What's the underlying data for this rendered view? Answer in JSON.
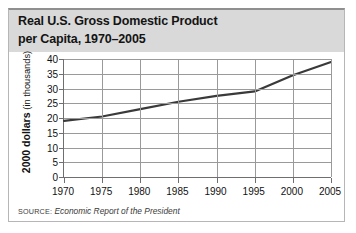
{
  "figure": {
    "title_line1": "Real U.S. Gross Domestic Product",
    "title_line2": "per Capita, 1970–2005",
    "source_label": "SOURCE:",
    "source_text": "Economic Report of the President",
    "colors": {
      "title_band": "#d9d9d9",
      "line": "#3a3a3a",
      "grid": "#9a9a9a",
      "axis": "#6f6f6f",
      "border": "#b6b6b6",
      "text": "#111111"
    }
  },
  "chart_data": {
    "type": "line",
    "title": "Real U.S. Gross Domestic Product per Capita, 1970–2005",
    "xlabel": "",
    "ylabel": "2000 dollars (in thousands)",
    "ylabel_bold": "2000 dollars",
    "ylabel_normal": "(in thousands)",
    "x": [
      1970,
      1975,
      1980,
      1985,
      1990,
      1995,
      2000,
      2005
    ],
    "values": [
      19,
      20.5,
      23,
      25.5,
      27.5,
      29,
      34.5,
      39
    ],
    "xtick_labels": [
      "1970",
      "1975",
      "1980",
      "1985",
      "1990",
      "1995",
      "2000",
      "2005"
    ],
    "ytick_labels": [
      "40",
      "35",
      "30",
      "25",
      "20",
      "15",
      "10",
      "5",
      "0"
    ],
    "yticks": [
      40,
      35,
      30,
      25,
      20,
      15,
      10,
      5,
      0
    ],
    "xlim": [
      1970,
      2005
    ],
    "ylim": [
      0,
      40
    ],
    "grid": true,
    "legend": "none",
    "series_name": "Real GDP per capita"
  }
}
